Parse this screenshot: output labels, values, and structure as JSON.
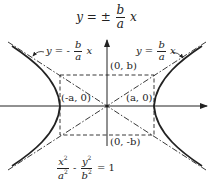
{
  "figure": {
    "title_equation": {
      "lhs": "y",
      "op": "= ±",
      "num": "b",
      "den": "a",
      "var": "x"
    },
    "asymptote_left": {
      "lhs": "y",
      "op": "= -",
      "num": "b",
      "den": "a",
      "var": "x"
    },
    "asymptote_right": {
      "lhs": "y",
      "op": "=",
      "num": "b",
      "den": "a",
      "var": "x"
    },
    "points": {
      "top": "(0, b)",
      "bottom": "(0, -b)",
      "left_vertex": "(-a, 0)",
      "right_vertex": "(a, 0)"
    },
    "hyperbola_equation": {
      "t1_num": "x",
      "t1_den": "a",
      "minus": "-",
      "t2_num": "y",
      "t2_den": "b",
      "sq": "2",
      "rhs": "= 1"
    },
    "colors": {
      "ink": "#222222",
      "background": "#ffffff"
    }
  }
}
